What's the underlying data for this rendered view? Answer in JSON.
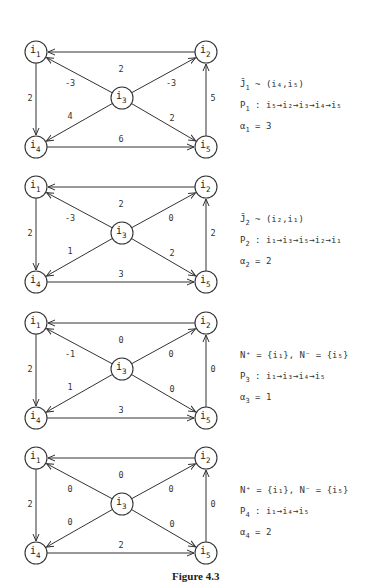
{
  "figure": {
    "caption": "Figure 4.3",
    "panels": [
      {
        "offset_y": 0,
        "weights": {
          "i2_i1": "2",
          "i3_i1": "-3",
          "i3_i2": "-3",
          "i1_i4": "2",
          "i5_i2": "5",
          "i3_i4": "4",
          "i3_i5": "2",
          "i4_i5": "6"
        },
        "notes": [
          {
            "main": "J̄",
            "sub": "1",
            "rest": " ~ (i₄,i₅)"
          },
          {
            "main": "P",
            "sub": "1",
            "rest": " : i₅→i₂→i₃→i₄→i₅"
          },
          {
            "main": "α",
            "sub": "1",
            "rest": " = 3"
          }
        ]
      },
      {
        "offset_y": 135,
        "weights": {
          "i2_i1": "2",
          "i3_i1": "-3",
          "i3_i2": "0",
          "i1_i4": "2",
          "i5_i2": "2",
          "i3_i4": "1",
          "i3_i5": "2",
          "i4_i5": "3"
        },
        "notes": [
          {
            "main": "J̄",
            "sub": "2",
            "rest": " ~ (i₂,i₁)"
          },
          {
            "main": "P",
            "sub": "2",
            "rest": " : i₁→i₃→i₅→i₂→i₁"
          },
          {
            "main": "α",
            "sub": "2",
            "rest": " = 2"
          }
        ]
      },
      {
        "offset_y": 271,
        "weights": {
          "i2_i1": "0",
          "i3_i1": "-1",
          "i3_i2": "0",
          "i1_i4": "2",
          "i5_i2": "0",
          "i3_i4": "1",
          "i3_i5": "0",
          "i4_i5": "3"
        },
        "notes": [
          {
            "main": "N⁺",
            "sub": "",
            "rest": " = {i₁},  N⁻ = {i₅}"
          },
          {
            "main": "P",
            "sub": "3",
            "rest": " : i₁→i₃→i₄→i₅"
          },
          {
            "main": "α",
            "sub": "3",
            "rest": " = 1"
          }
        ]
      },
      {
        "offset_y": 406,
        "weights": {
          "i2_i1": "0",
          "i3_i1": "0",
          "i3_i2": "0",
          "i1_i4": "2",
          "i5_i2": "0",
          "i3_i4": "0",
          "i3_i5": "0",
          "i4_i5": "2"
        },
        "notes": [
          {
            "main": "N⁺",
            "sub": "",
            "rest": " = {i₁},    N⁻ = {i₅}"
          },
          {
            "main": "P",
            "sub": "4",
            "rest": " : i₁→i₄→i₅"
          },
          {
            "main": "α",
            "sub": "4",
            "rest": " = 2"
          }
        ]
      }
    ],
    "nodes": [
      "i1",
      "i2",
      "i3",
      "i4",
      "i5"
    ],
    "edges": [
      {
        "from": "i2",
        "to": "i1"
      },
      {
        "from": "i3",
        "to": "i1"
      },
      {
        "from": "i3",
        "to": "i2"
      },
      {
        "from": "i1",
        "to": "i4"
      },
      {
        "from": "i5",
        "to": "i2"
      },
      {
        "from": "i3",
        "to": "i4"
      },
      {
        "from": "i3",
        "to": "i5"
      },
      {
        "from": "i4",
        "to": "i5"
      }
    ]
  }
}
